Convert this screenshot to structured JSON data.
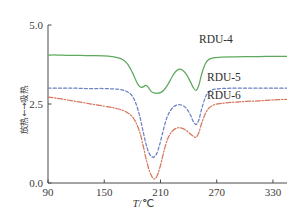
{
  "chart_data": {
    "type": "line",
    "title": "",
    "xlabel": "T/℃",
    "ylabel": "放热←→吸热",
    "xlim": [
      90,
      345
    ],
    "ylim": [
      0.0,
      5.0
    ],
    "xticks": [
      "90",
      "150",
      "210",
      "270",
      "330"
    ],
    "xtick_values": [
      90,
      150,
      210,
      270,
      330
    ],
    "yticks": [
      "0.0",
      "2.5",
      "5.0"
    ],
    "ytick_values": [
      0.0,
      2.5,
      5.0
    ],
    "grid": false,
    "legend_position": "inline-right",
    "series": [
      {
        "name": "RDU-4",
        "color": "#5ea95e",
        "style": "solid",
        "x": [
          90,
          100,
          110,
          120,
          130,
          140,
          150,
          158,
          164,
          170,
          175,
          180,
          183,
          186,
          189,
          192,
          194,
          196,
          198,
          200,
          203,
          206,
          210,
          214,
          218,
          222,
          226,
          230,
          234,
          238,
          242,
          245,
          248,
          251,
          254,
          258,
          262,
          268,
          275,
          285,
          300,
          315,
          330,
          345
        ],
        "y": [
          4.05,
          4.05,
          4.04,
          4.04,
          4.03,
          4.03,
          4.02,
          4.0,
          3.97,
          3.9,
          3.76,
          3.5,
          3.3,
          3.12,
          3.03,
          3.05,
          3.09,
          3.06,
          2.98,
          2.9,
          2.85,
          2.84,
          2.86,
          2.95,
          3.12,
          3.34,
          3.52,
          3.6,
          3.56,
          3.42,
          3.2,
          3.02,
          2.93,
          3.1,
          3.45,
          3.78,
          3.92,
          3.97,
          3.98,
          3.99,
          4.0,
          4.0,
          4.01,
          4.01
        ]
      },
      {
        "name": "RDU-5",
        "color": "#6d81c4",
        "style": "dashed",
        "x": [
          90,
          100,
          110,
          120,
          130,
          140,
          150,
          158,
          164,
          170,
          175,
          180,
          184,
          188,
          191,
          194,
          197,
          200,
          203,
          206,
          209,
          212,
          215,
          218,
          222,
          226,
          230,
          234,
          238,
          242,
          245,
          248,
          251,
          254,
          258,
          262,
          268,
          275,
          285,
          300,
          315,
          330,
          345
        ],
        "y": [
          3.0,
          3.0,
          3.0,
          3.0,
          2.99,
          2.99,
          2.99,
          2.98,
          2.97,
          2.94,
          2.88,
          2.75,
          2.5,
          2.1,
          1.7,
          1.3,
          1.0,
          0.85,
          0.82,
          0.93,
          1.2,
          1.55,
          1.9,
          2.15,
          2.35,
          2.45,
          2.48,
          2.45,
          2.35,
          2.15,
          1.95,
          1.85,
          2.0,
          2.35,
          2.72,
          2.9,
          2.97,
          2.99,
          3.0,
          3.0,
          3.0,
          3.0,
          3.0
        ]
      },
      {
        "name": "RDU-6",
        "color": "#d5765d",
        "style": "dashdot",
        "x": [
          90,
          100,
          110,
          120,
          130,
          140,
          150,
          158,
          164,
          170,
          175,
          180,
          184,
          188,
          191,
          194,
          197,
          200,
          203,
          206,
          209,
          212,
          215,
          218,
          222,
          226,
          230,
          234,
          238,
          242,
          245,
          248,
          251,
          254,
          258,
          262,
          268,
          275,
          285,
          300,
          315,
          330,
          345
        ],
        "y": [
          2.72,
          2.68,
          2.63,
          2.58,
          2.53,
          2.48,
          2.43,
          2.39,
          2.35,
          2.3,
          2.22,
          2.1,
          1.9,
          1.6,
          1.25,
          0.85,
          0.5,
          0.25,
          0.13,
          0.2,
          0.45,
          0.8,
          1.15,
          1.42,
          1.62,
          1.72,
          1.75,
          1.72,
          1.65,
          1.55,
          1.48,
          1.45,
          1.6,
          1.9,
          2.2,
          2.38,
          2.48,
          2.52,
          2.55,
          2.58,
          2.6,
          2.63,
          2.65
        ]
      }
    ]
  },
  "axes": {
    "x_title_symbol": "T",
    "x_title_unit": "/℃",
    "y_title": "放热←→吸热"
  },
  "labels": {
    "rdu4": "RDU-4",
    "rdu5": "RDU-5",
    "rdu6": "RDU-6"
  }
}
